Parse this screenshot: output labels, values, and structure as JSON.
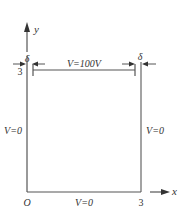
{
  "diagram": {
    "type": "potential-boundary-box",
    "axes": {
      "x_label": "x",
      "y_label": "y",
      "origin_label": "O"
    },
    "ticks": {
      "x_end": "3",
      "y_end": "3"
    },
    "boundaries": {
      "top": "V=100V",
      "left": "V=0",
      "right": "V=0",
      "bottom": "V=0"
    },
    "gap_label_left": "δ",
    "gap_label_right": "δ",
    "colors": {
      "line": "#555555",
      "text": "#333333",
      "background": "#ffffff"
    }
  }
}
